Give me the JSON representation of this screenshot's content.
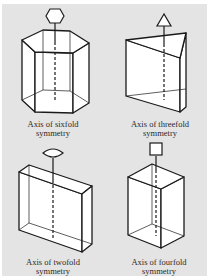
{
  "figures": [
    {
      "id": "sixfold",
      "symbol": "hexagon",
      "shape": "hexagonal-prism",
      "caption": {
        "line1": "Axis of sixfold",
        "line2": "symmetry"
      }
    },
    {
      "id": "threefold",
      "symbol": "triangle",
      "shape": "triangular-prism",
      "caption": {
        "line1": "Axis of threefold",
        "line2": "symmetry"
      }
    },
    {
      "id": "twofold",
      "symbol": "lens",
      "shape": "rectangular-slab",
      "caption": {
        "line1": "Axis of twofold",
        "line2": "symmetry"
      }
    },
    {
      "id": "fourfold",
      "symbol": "square",
      "shape": "square-prism",
      "caption": {
        "line1": "Axis of fourfold",
        "line2": "symmetry"
      }
    }
  ],
  "colors": {
    "panel_background": "#e4e4e4",
    "face_fill": "#ffffff",
    "line": "#1a1a1a",
    "text": "#2a2a2a"
  }
}
